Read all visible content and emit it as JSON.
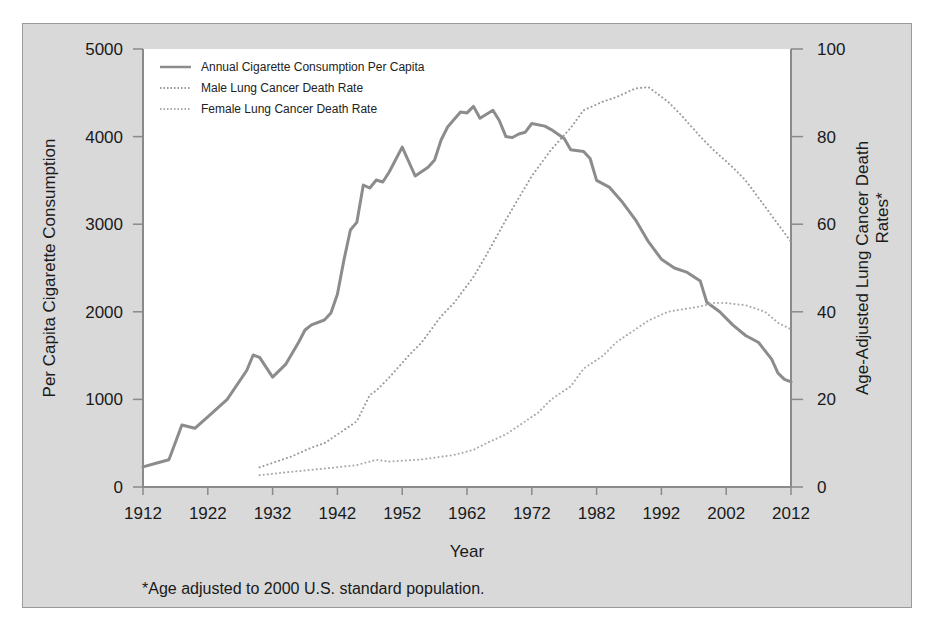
{
  "chart_data": {
    "type": "line",
    "title": "",
    "xlabel": "Year",
    "ylabel": "Per Capita Cigarette Consumption",
    "y2label_line1": "Age-Adjusted Lung Cancer Death",
    "y2label_line2": "Rates*",
    "footnote": "*Age adjusted to 2000 U.S. standard population.",
    "xlim": [
      1912,
      2012
    ],
    "ylim": [
      0,
      5000
    ],
    "y2lim": [
      0,
      100
    ],
    "x_ticks": [
      1912,
      1922,
      1932,
      1942,
      1952,
      1962,
      1972,
      1982,
      1992,
      2002,
      2012
    ],
    "y_ticks": [
      0,
      1000,
      2000,
      3000,
      4000,
      5000
    ],
    "y2_ticks": [
      0,
      20,
      40,
      60,
      80,
      100
    ],
    "legend_position": "upper left",
    "grid": false,
    "series": [
      {
        "name": "Annual Cigarette Consumption Per Capita",
        "axis": "left",
        "style": "solid",
        "color": "#8c8c8c",
        "x": [
          1912,
          1914,
          1916,
          1918,
          1920,
          1922,
          1925,
          1928,
          1929,
          1930,
          1932,
          1934,
          1936,
          1937,
          1938,
          1940,
          1941,
          1942,
          1943,
          1944,
          1945,
          1946,
          1947,
          1948,
          1949,
          1950,
          1952,
          1954,
          1956,
          1957,
          1958,
          1959,
          1961,
          1962,
          1963,
          1964,
          1966,
          1967,
          1968,
          1969,
          1970,
          1971,
          1972,
          1974,
          1975,
          1977,
          1978,
          1980,
          1981,
          1982,
          1984,
          1986,
          1988,
          1990,
          1992,
          1994,
          1996,
          1998,
          1999,
          2001,
          2003,
          2005,
          2007,
          2009,
          2010,
          2011,
          2012
        ],
        "values": [
          230,
          270,
          310,
          708,
          670,
          800,
          1000,
          1330,
          1507,
          1480,
          1255,
          1400,
          1650,
          1792,
          1850,
          1906,
          1986,
          2200,
          2590,
          2934,
          3020,
          3446,
          3413,
          3505,
          3482,
          3596,
          3880,
          3550,
          3650,
          3733,
          3961,
          4110,
          4280,
          4270,
          4345,
          4210,
          4300,
          4180,
          4000,
          3990,
          4030,
          4050,
          4150,
          4120,
          4080,
          3980,
          3850,
          3830,
          3750,
          3500,
          3420,
          3250,
          3050,
          2800,
          2600,
          2500,
          2450,
          2350,
          2110,
          2000,
          1850,
          1730,
          1650,
          1460,
          1300,
          1230,
          1200
        ]
      },
      {
        "name": "Male Lung Cancer Death Rate",
        "axis": "right",
        "style": "dotted",
        "color": "#999999",
        "x": [
          1930,
          1933,
          1935,
          1938,
          1940,
          1943,
          1945,
          1947,
          1948,
          1950,
          1953,
          1955,
          1958,
          1960,
          1963,
          1965,
          1968,
          1970,
          1972,
          1975,
          1978,
          1980,
          1983,
          1985,
          1988,
          1990,
          1993,
          1995,
          1998,
          2000,
          2003,
          2005,
          2008,
          2010,
          2012
        ],
        "values": [
          4.5,
          6,
          7,
          9,
          10,
          13,
          15,
          21,
          22,
          25,
          30,
          33,
          39,
          42,
          48,
          53,
          61,
          66,
          71,
          77,
          82,
          86,
          88,
          89,
          91,
          91.3,
          88,
          85,
          80,
          77,
          73,
          70,
          64,
          60,
          56
        ]
      },
      {
        "name": "Female Lung Cancer Death Rate",
        "axis": "right",
        "style": "dotted",
        "color": "#aaaaaa",
        "x": [
          1930,
          1935,
          1940,
          1945,
          1948,
          1950,
          1955,
          1960,
          1963,
          1965,
          1968,
          1970,
          1973,
          1975,
          1978,
          1980,
          1983,
          1985,
          1988,
          1990,
          1993,
          1995,
          1998,
          2000,
          2002,
          2005,
          2008,
          2010,
          2012
        ],
        "values": [
          2.7,
          3.5,
          4.2,
          5,
          6.2,
          5.8,
          6.3,
          7.3,
          8.5,
          10,
          12,
          14,
          17,
          20,
          23,
          27,
          30,
          33,
          36,
          38,
          40,
          40.5,
          41.2,
          42,
          42,
          41.5,
          40,
          37.5,
          36
        ]
      }
    ]
  },
  "legend": {
    "items": [
      {
        "label": "Annual Cigarette Consumption Per Capita"
      },
      {
        "label": "Male Lung Cancer Death Rate"
      },
      {
        "label": "Female Lung Cancer Death Rate"
      }
    ]
  }
}
